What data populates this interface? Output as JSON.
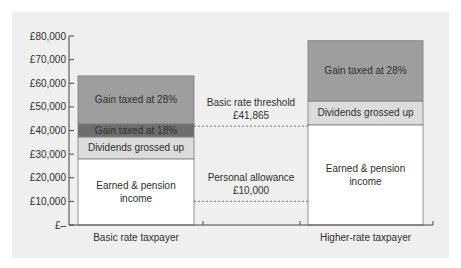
{
  "chart_data": {
    "type": "bar",
    "stacked": true,
    "title": "",
    "xlabel": "",
    "ylabel": "",
    "ylim": [
      0,
      80000
    ],
    "y_ticks": [
      "£–",
      "£10,000",
      "£20,000",
      "£30,000",
      "£40,000",
      "£50,000",
      "£60,000",
      "£70,000",
      "£80,000"
    ],
    "y_tick_values": [
      0,
      10000,
      20000,
      30000,
      40000,
      50000,
      60000,
      70000,
      80000
    ],
    "categories": [
      "Basic rate taxpayer",
      "Higher-rate taxpayer"
    ],
    "bars": [
      {
        "category": "Basic rate taxpayer",
        "segments": [
          {
            "label_lines": [
              "Earned  & pension",
              "income"
            ],
            "from": 0,
            "to": 28000,
            "color": "#ffffff",
            "text_color": "#2e2e2e"
          },
          {
            "label_lines": [
              "Dividends grossed up"
            ],
            "from": 28000,
            "to": 37300,
            "color": "#dcdcdc",
            "text_color": "#2e2e2e"
          },
          {
            "label_lines": [
              "Gain taxed at 18%"
            ],
            "from": 37300,
            "to": 42800,
            "color": "#6e6e6e",
            "text_color": "#f0f0f0"
          },
          {
            "label_lines": [
              "Gain taxed at 28%"
            ],
            "from": 42800,
            "to": 63100,
            "color": "#9e9e9e",
            "text_color": "#2e2e2e"
          }
        ]
      },
      {
        "category": "Higher-rate taxpayer",
        "segments": [
          {
            "label_lines": [
              "Earned  & pension",
              "income"
            ],
            "from": 0,
            "to": 42400,
            "color": "#ffffff",
            "text_color": "#2e2e2e"
          },
          {
            "label_lines": [
              "Dividends grossed up"
            ],
            "from": 42400,
            "to": 52500,
            "color": "#dcdcdc",
            "text_color": "#2e2e2e"
          },
          {
            "label_lines": [
              "Gain taxed at 28%"
            ],
            "from": 52500,
            "to": 78000,
            "color": "#9e9e9e",
            "text_color": "#2e2e2e"
          }
        ]
      }
    ],
    "reference_lines": [
      {
        "name": "basic-rate-threshold",
        "value": 41865,
        "label_lines": [
          "Basic rate threshold",
          "£41,865"
        ],
        "style": "dashed"
      },
      {
        "name": "personal-allowance",
        "value": 10000,
        "label_lines": [
          "Personal allowance",
          "£10,000"
        ],
        "style": "dashed"
      }
    ],
    "grid": false,
    "legend": "none"
  }
}
